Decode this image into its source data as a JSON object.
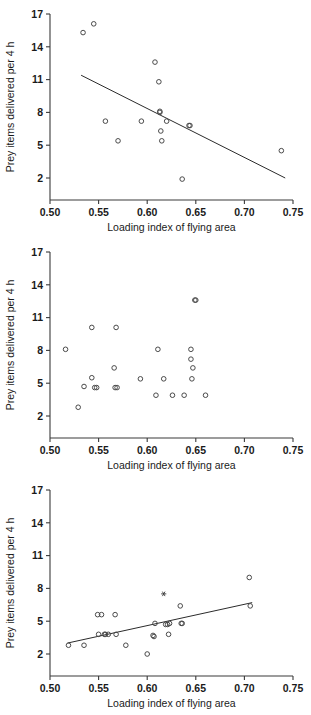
{
  "figure": {
    "name": "three-scatter-panels",
    "width": 311,
    "height": 715,
    "background": "#ffffff",
    "marker_color": "#4a4a4a",
    "line_color": "#2b2b2b"
  },
  "axis": {
    "xlabel": "Loading index of flying area",
    "ylabel": "Prey items delivered per 4 h",
    "xticks": [
      "0.50",
      "0.55",
      "0.60",
      "0.65",
      "0.70",
      "0.75"
    ],
    "yticks": [
      "17",
      "14",
      "11",
      "8",
      "5",
      "2"
    ],
    "xlim": [
      0.5,
      0.75
    ],
    "ylim": [
      2,
      17
    ]
  },
  "chart_data": [
    {
      "type": "scatter",
      "panel": "top",
      "title": "",
      "xlabel": "Loading index of flying area",
      "ylabel": "Prey items delivered per 4 h",
      "xlim": [
        0.5,
        0.75
      ],
      "ylim": [
        2,
        17
      ],
      "xticks": [
        0.5,
        0.55,
        0.6,
        0.65,
        0.7,
        0.75
      ],
      "yticks": [
        2,
        5,
        8,
        11,
        14,
        17
      ],
      "grid": false,
      "legend": "none",
      "trendline": {
        "visible": true,
        "x": [
          0.532,
          0.742
        ],
        "y": [
          11.4,
          2.0
        ],
        "direction": "negative"
      },
      "x": [
        0.534,
        0.545,
        0.557,
        0.57,
        0.594,
        0.608,
        0.612,
        0.613,
        0.613,
        0.614,
        0.615,
        0.62,
        0.636,
        0.643,
        0.644,
        0.738
      ],
      "y": [
        15.3,
        16.1,
        7.2,
        5.4,
        7.2,
        12.6,
        10.8,
        8.1,
        8.0,
        6.3,
        5.4,
        7.2,
        1.9,
        6.8,
        6.8,
        4.5
      ]
    },
    {
      "type": "scatter",
      "panel": "middle",
      "title": "",
      "xlabel": "Loading index of flying area",
      "ylabel": "Prey items delivered per 4 h",
      "xlim": [
        0.5,
        0.75
      ],
      "ylim": [
        2,
        17
      ],
      "xticks": [
        0.5,
        0.55,
        0.6,
        0.65,
        0.7,
        0.75
      ],
      "yticks": [
        2,
        5,
        8,
        11,
        14,
        17
      ],
      "grid": false,
      "legend": "none",
      "trendline": {
        "visible": false
      },
      "x": [
        0.516,
        0.529,
        0.535,
        0.543,
        0.543,
        0.546,
        0.548,
        0.566,
        0.567,
        0.568,
        0.569,
        0.593,
        0.609,
        0.611,
        0.617,
        0.626,
        0.638,
        0.645,
        0.645,
        0.646,
        0.647,
        0.649,
        0.65,
        0.66
      ],
      "y": [
        8.1,
        2.8,
        4.7,
        10.1,
        5.5,
        4.6,
        4.6,
        6.4,
        4.6,
        10.1,
        4.6,
        5.4,
        3.9,
        8.1,
        5.4,
        3.9,
        3.9,
        8.1,
        7.2,
        5.4,
        6.4,
        12.6,
        12.6,
        3.9
      ]
    },
    {
      "type": "scatter",
      "panel": "bottom",
      "title": "",
      "xlabel": "Loading index of flying area",
      "ylabel": "Prey items delivered per 4 h",
      "xlim": [
        0.5,
        0.75
      ],
      "ylim": [
        2,
        17
      ],
      "xticks": [
        0.5,
        0.55,
        0.6,
        0.65,
        0.7,
        0.75
      ],
      "yticks": [
        2,
        5,
        8,
        11,
        14,
        17
      ],
      "grid": false,
      "legend": "none",
      "trendline": {
        "visible": true,
        "x": [
          0.518,
          0.708
        ],
        "y": [
          3.0,
          6.7
        ],
        "direction": "positive"
      },
      "x": [
        0.519,
        0.535,
        0.549,
        0.55,
        0.553,
        0.556,
        0.557,
        0.56,
        0.567,
        0.568,
        0.578,
        0.6,
        0.606,
        0.607,
        0.608,
        0.619,
        0.621,
        0.622,
        0.623,
        0.634,
        0.635,
        0.636,
        0.705,
        0.706
      ],
      "y": [
        2.8,
        2.8,
        5.6,
        3.8,
        5.6,
        3.8,
        3.8,
        3.8,
        5.6,
        3.8,
        2.8,
        2.0,
        3.7,
        3.6,
        4.8,
        4.7,
        4.7,
        3.8,
        4.8,
        6.4,
        4.8,
        4.8,
        9.0,
        6.4
      ],
      "special_points": [
        {
          "x": 0.617,
          "y": 7.5,
          "marker": "asterisk"
        }
      ]
    }
  ]
}
